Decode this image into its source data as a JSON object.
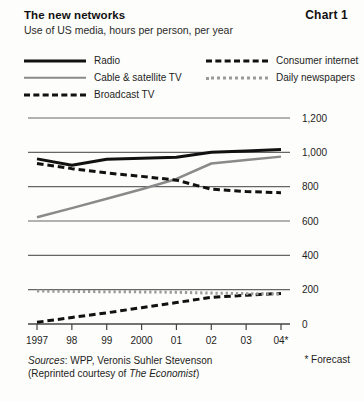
{
  "header": {
    "title": "The new networks",
    "subtitle": "Use of US media, hours per person, per year",
    "chart_number": "Chart 1"
  },
  "footer": {
    "sources_label": "Sources",
    "sources_text": ": WPP, Veronis Suhler Stevenson",
    "reprint_prefix": "(Reprinted courtesy of ",
    "reprint_italic": "The Economist",
    "reprint_suffix": ")",
    "forecast_note": "* Forecast"
  },
  "chart_data": {
    "type": "line",
    "title": "The new networks",
    "subtitle": "Use of US media, hours per person, per year",
    "xlabel": "",
    "ylabel": "",
    "x": [
      "1997",
      "98",
      "99",
      "2000",
      "01",
      "02",
      "03",
      "04*"
    ],
    "categories": [
      "1997",
      "98",
      "99",
      "2000",
      "01",
      "02",
      "03",
      "04*"
    ],
    "ylim": [
      0,
      1200
    ],
    "yticks": [
      0,
      200,
      400,
      600,
      800,
      1000,
      1200
    ],
    "ytick_labels": [
      "0",
      "200",
      "400",
      "600",
      "800",
      "1,000",
      "1,200"
    ],
    "grid": true,
    "legend_position": "above-plot",
    "series": [
      {
        "name": "Radio",
        "style": "solid",
        "color": "#111111",
        "width": 3,
        "values": [
          962,
          925,
          960,
          965,
          972,
          1000,
          1008,
          1016
        ]
      },
      {
        "name": "Cable & satellite TV",
        "style": "solid",
        "color": "#8a8a8a",
        "width": 2.5,
        "values": [
          622,
          675,
          730,
          785,
          845,
          935,
          955,
          975
        ]
      },
      {
        "name": "Broadcast TV",
        "style": "dashed",
        "color": "#111111",
        "width": 3,
        "values": [
          935,
          905,
          880,
          860,
          838,
          785,
          772,
          765
        ]
      },
      {
        "name": "Consumer internet",
        "style": "dashed",
        "color": "#111111",
        "width": 3,
        "values": [
          10,
          38,
          65,
          95,
          125,
          155,
          168,
          178
        ]
      },
      {
        "name": "Daily newspapers",
        "style": "dotted",
        "color": "#9a9a9a",
        "width": 3,
        "values": [
          192,
          190,
          188,
          187,
          185,
          180,
          177,
          175
        ]
      }
    ],
    "annotations": [
      "* Forecast"
    ]
  }
}
